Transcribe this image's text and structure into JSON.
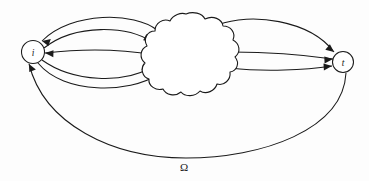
{
  "figure": {
    "type": "diagram",
    "background_color": "#fdfdfd",
    "line_color": "#1a1a1a",
    "width": 369,
    "height": 181
  },
  "nodes": [
    {
      "id": "i",
      "label": "i",
      "shape": "circle",
      "cx": 33,
      "cy": 52,
      "r": 11.5
    },
    {
      "id": "t",
      "label": "t",
      "shape": "circle",
      "cx": 343,
      "cy": 62,
      "r": 10.5
    }
  ],
  "cloud": {
    "name": "network-cloud",
    "label": "",
    "bounds": {
      "x": 150,
      "y": 14,
      "width": 87,
      "height": 89
    }
  },
  "labels": {
    "omega": "Ω"
  },
  "edges": [
    {
      "id": "e1",
      "from": "cloud",
      "to": "i",
      "direction": "to-i",
      "style": "arc-upper"
    },
    {
      "id": "e2",
      "from": "i",
      "to": "cloud",
      "direction": "to-cloud",
      "style": "arc-upper-inner"
    },
    {
      "id": "e3",
      "from": "cloud",
      "to": "i",
      "direction": "to-i",
      "style": "near-straight"
    },
    {
      "id": "e4",
      "from": "i",
      "to": "cloud",
      "direction": "to-cloud",
      "style": "arc-lower"
    },
    {
      "id": "e5",
      "from": "cloud",
      "to": "t",
      "direction": "to-t",
      "style": "arc-upper"
    },
    {
      "id": "e6",
      "from": "cloud",
      "to": "t",
      "direction": "to-t",
      "style": "near-straight"
    },
    {
      "id": "e7",
      "from": "cloud",
      "to": "t",
      "direction": "to-t",
      "style": "arc-lower"
    },
    {
      "id": "e8",
      "from": "t",
      "to": "i",
      "direction": "to-i",
      "style": "long-bottom-arc",
      "label": "Ω"
    }
  ]
}
